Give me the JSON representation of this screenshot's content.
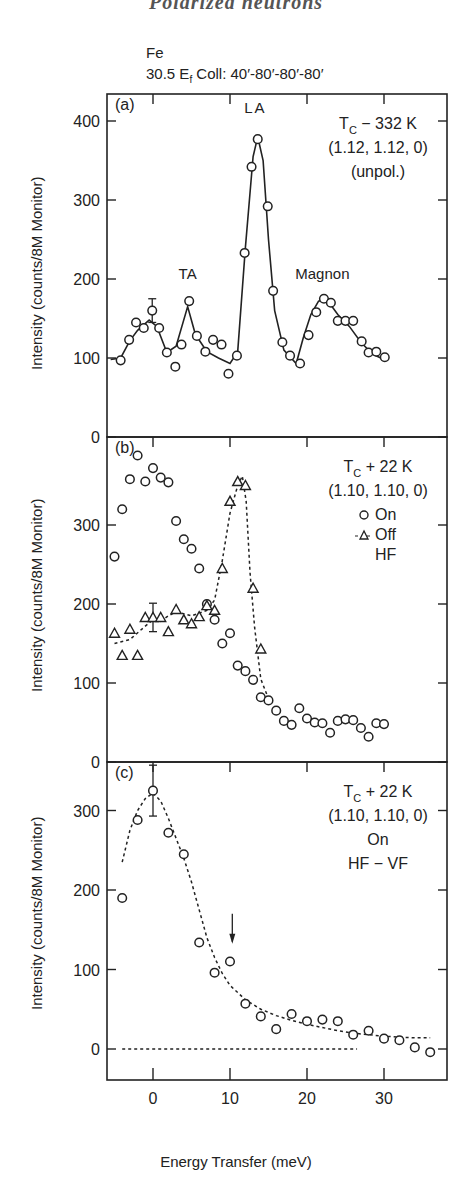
{
  "figure": {
    "title": "Polarized neutrons",
    "sample": "Fe",
    "setup": "30.5 E",
    "setup_sub": "f",
    "setup_rest": " Coll: 40′-80′-80′-80′",
    "ylabel": "Intensity (counts/8M Monitor)",
    "xlabel": "Energy Transfer (meV)",
    "x_ticks": [
      "0",
      "10",
      "20",
      "30"
    ]
  },
  "chart_data": [
    {
      "panel": "(a)",
      "type": "line",
      "title": "T_C − 332 K, (1.12, 1.12, 0) (unpol.)",
      "annotations": [
        "T",
        "C",
        "− 332 K",
        "(1.12, 1.12, 0)",
        "(unpol.)"
      ],
      "peak_labels": [
        {
          "text": "TA",
          "x": 4.5,
          "y": 200
        },
        {
          "text": "LA",
          "x": 13.3,
          "y": 410
        },
        {
          "text": "Magnon",
          "x": 22,
          "y": 200
        }
      ],
      "xlabel": "Energy Transfer (meV)",
      "ylabel": "Intensity (counts/8M Monitor)",
      "xlim": [
        -6,
        38
      ],
      "ylim": [
        0,
        435
      ],
      "y_ticks": [
        0,
        100,
        200,
        300,
        400
      ],
      "series": [
        {
          "name": "unpolarized",
          "marker": "circle",
          "x": [
            -4.2,
            -3.1,
            -2.2,
            -1.2,
            -0.1,
            0.8,
            1.8,
            2.9,
            3.7,
            4.7,
            5.7,
            6.8,
            7.8,
            8.9,
            9.8,
            10.9,
            11.9,
            12.8,
            13.6,
            14.9,
            15.6,
            16.8,
            17.8,
            19.1,
            20.2,
            21.2,
            22.2,
            23.1,
            24.0,
            25.0,
            26.0,
            27.1,
            28.0,
            29.0,
            30.1
          ],
          "y": [
            97,
            123,
            145,
            138,
            160,
            138,
            107,
            89,
            117,
            172,
            128,
            108,
            123,
            117,
            80,
            103,
            233,
            342,
            377,
            292,
            185,
            120,
            103,
            93,
            129,
            158,
            175,
            170,
            147,
            147,
            147,
            121,
            107,
            108,
            101
          ],
          "error_bar": {
            "x": -0.1,
            "y": 160,
            "err": 15
          }
        }
      ],
      "fit_line": {
        "style": "solid",
        "x": [
          -5.5,
          -4.2,
          -3,
          -2,
          -0.5,
          0.5,
          1.8,
          3,
          4.5,
          5.5,
          7,
          8.5,
          10,
          11,
          12,
          13,
          13.6,
          14.3,
          15,
          15.8,
          17,
          18.6,
          19.5,
          20.5,
          21.5,
          22.5,
          24,
          25.5,
          27,
          28.5,
          30
        ],
        "y": [
          98,
          100,
          122,
          135,
          148,
          140,
          107,
          115,
          165,
          130,
          108,
          100,
          93,
          108,
          240,
          355,
          380,
          350,
          250,
          160,
          110,
          93,
          125,
          155,
          172,
          175,
          155,
          140,
          120,
          105,
          98
        ]
      }
    },
    {
      "panel": "(b)",
      "type": "scatter",
      "title": "T_C + 22 K, (1.10, 1.10, 0)",
      "annotations": [
        "T",
        "C",
        "+ 22 K",
        "(1.10, 1.10, 0)",
        "On",
        "Off",
        "HF"
      ],
      "legend": [
        {
          "marker": "circle",
          "label": "On"
        },
        {
          "marker": "triangle",
          "label": "Off"
        },
        {
          "marker": "",
          "label": "HF"
        }
      ],
      "xlim": [
        -6,
        38
      ],
      "ylim": [
        0,
        410
      ],
      "y_ticks": [
        0,
        100,
        200,
        300
      ],
      "series": [
        {
          "name": "On",
          "marker": "circle",
          "x": [
            -5,
            -4,
            -3,
            -2,
            -1,
            0,
            1,
            2,
            3,
            4,
            5,
            6,
            7,
            8,
            9,
            10,
            11,
            12,
            13,
            14,
            15,
            16,
            17,
            18,
            19,
            20,
            21,
            22,
            23,
            24,
            25,
            26,
            27,
            28,
            29,
            30
          ],
          "y": [
            260,
            320,
            358,
            388,
            355,
            372,
            360,
            354,
            305,
            282,
            270,
            245,
            200,
            180,
            150,
            163,
            122,
            115,
            104,
            82,
            78,
            65,
            52,
            47,
            68,
            55,
            50,
            49,
            37,
            52,
            54,
            53,
            43,
            32,
            49,
            48
          ]
        },
        {
          "name": "Off",
          "marker": "triangle",
          "x": [
            -5,
            -4,
            -3,
            -2,
            -1,
            0,
            1,
            2,
            3,
            4,
            5,
            6,
            7,
            8,
            9,
            10,
            11,
            12,
            13,
            14
          ],
          "y": [
            163,
            135,
            168,
            135,
            183,
            183,
            183,
            165,
            193,
            180,
            175,
            184,
            198,
            192,
            245,
            330,
            355,
            350,
            220,
            143
          ],
          "error_bar": {
            "x": 0,
            "y": 183,
            "err": 18
          }
        }
      ],
      "fit_line": {
        "style": "dashed",
        "x": [
          -5,
          -3,
          -1,
          0,
          1,
          2,
          3,
          5,
          7,
          8,
          9,
          10,
          11,
          11.6,
          12.1,
          12.6,
          13.2,
          14,
          15
        ],
        "y": [
          150,
          155,
          172,
          180,
          178,
          185,
          190,
          185,
          192,
          205,
          255,
          315,
          350,
          362,
          330,
          240,
          170,
          105,
          80
        ]
      }
    },
    {
      "panel": "(c)",
      "type": "scatter",
      "title": "T_C + 22 K, (1.10, 1.10, 0) On, HF − VF",
      "annotations": [
        "T",
        "C",
        "+ 22 K",
        "(1.10, 1.10, 0)",
        "On",
        "HF − VF"
      ],
      "arrow": {
        "x": 10.3,
        "y_from": 170,
        "y_to": 135
      },
      "xlim": [
        -6,
        38
      ],
      "ylim": [
        -40,
        362
      ],
      "y_ticks": [
        0,
        100,
        200,
        300
      ],
      "series": [
        {
          "name": "HF - VF",
          "marker": "circle",
          "x": [
            -4,
            -2,
            0,
            2,
            4,
            6,
            8,
            10,
            12,
            14,
            16,
            18,
            20,
            22,
            24,
            26,
            28,
            30,
            32,
            34,
            36
          ],
          "y": [
            190,
            288,
            325,
            272,
            245,
            134,
            96,
            110,
            57,
            41,
            25,
            44,
            35,
            37,
            35,
            18,
            23,
            13,
            11,
            2,
            -4
          ],
          "error_bar": {
            "x": 0,
            "y": 325,
            "err": 32
          }
        }
      ],
      "fit_line": {
        "style": "dashed",
        "x": [
          -4,
          -3,
          -2,
          -1,
          0,
          1,
          2,
          3,
          4,
          5,
          6,
          7,
          8,
          9,
          10,
          12,
          14,
          16,
          18,
          20,
          22,
          24,
          26,
          28,
          30,
          32,
          34,
          36
        ],
        "y": [
          235,
          275,
          300,
          315,
          322,
          312,
          290,
          265,
          240,
          210,
          175,
          140,
          115,
          95,
          80,
          62,
          50,
          42,
          36,
          31,
          27,
          23,
          20,
          18,
          16,
          15,
          14,
          14
        ]
      },
      "baseline": {
        "style": "dashed",
        "x": [
          -4,
          26.5
        ],
        "y": [
          0,
          0
        ]
      }
    }
  ]
}
